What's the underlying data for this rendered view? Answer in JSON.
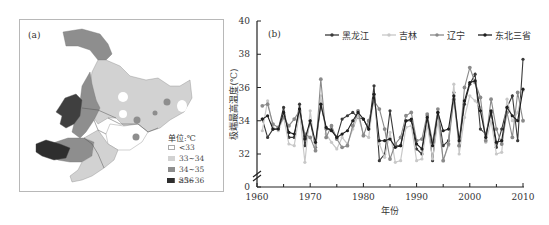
{
  "panel_a": {
    "label": "(a)",
    "legend_title": "单位:℃",
    "legend": [
      {
        "label": "<33",
        "color": "#ffffff"
      },
      {
        "label": "33~34",
        "color": "#d2d2d2"
      },
      {
        "label": "34~35",
        "color": "#8e8e8e"
      },
      {
        "label": "35~36",
        "color": "#5a5a5a"
      },
      {
        "label": "≥36",
        "color": "#2e2e2e"
      }
    ]
  },
  "chart_data": {
    "type": "line",
    "panel_label": "(b)",
    "title": "",
    "xlabel": "年份",
    "ylabel": "极端最高温度(℃)",
    "x_ticks": [
      "1960",
      "1970",
      "1980",
      "1990",
      "2000",
      "2010"
    ],
    "y_ticks": [
      "0",
      "32",
      "34",
      "36",
      "38",
      "40"
    ],
    "ylim": [
      31,
      40
    ],
    "y_axis_break": true,
    "xlim": [
      1960,
      2010
    ],
    "legend_position": "top-right",
    "x": [
      1961,
      1962,
      1963,
      1964,
      1965,
      1966,
      1967,
      1968,
      1969,
      1970,
      1971,
      1972,
      1973,
      1974,
      1975,
      1976,
      1977,
      1978,
      1979,
      1980,
      1981,
      1982,
      1983,
      1984,
      1985,
      1986,
      1987,
      1988,
      1989,
      1990,
      1991,
      1992,
      1993,
      1994,
      1995,
      1996,
      1997,
      1998,
      1999,
      2000,
      2001,
      2002,
      2003,
      2004,
      2005,
      2006,
      2007,
      2008,
      2009,
      2010
    ],
    "series": [
      {
        "name": "黑龙江",
        "color": "#3a3a3a",
        "values": [
          34.1,
          33.0,
          33.5,
          33.5,
          34.8,
          33.0,
          33.0,
          35.0,
          32.5,
          34.0,
          32.4,
          35.0,
          33.5,
          33.5,
          33.0,
          34.1,
          34.3,
          34.5,
          34.2,
          34.1,
          33.5,
          36.1,
          31.6,
          32.0,
          34.6,
          32.5,
          32.5,
          34.0,
          34.0,
          32.3,
          32.0,
          34.3,
          31.6,
          34.5,
          32.5,
          32.8,
          35.7,
          32.5,
          35.0,
          36.2,
          36.8,
          33.5,
          33.2,
          34.5,
          32.4,
          33.5,
          34.8,
          35.5,
          32.8,
          37.7
        ]
      },
      {
        "name": "吉林",
        "color": "#c8c8c8",
        "values": [
          33.4,
          35.2,
          33.6,
          33.4,
          34.2,
          32.6,
          32.5,
          34.5,
          31.5,
          34.6,
          32.2,
          35.5,
          33.2,
          32.7,
          32.3,
          33.0,
          32.6,
          33.5,
          34.3,
          33.2,
          33.0,
          35.5,
          32.6,
          31.8,
          33.3,
          31.5,
          31.6,
          33.6,
          33.7,
          31.6,
          31.7,
          33.8,
          31.7,
          34.0,
          31.6,
          32.5,
          36.2,
          32.0,
          34.2,
          35.5,
          35.2,
          34.8,
          32.7,
          34.0,
          32.0,
          32.1,
          35.3,
          34.0,
          34.5,
          35.8
        ]
      },
      {
        "name": "辽宁",
        "color": "#8a8a8a",
        "values": [
          34.9,
          35.0,
          33.8,
          33.6,
          34.2,
          33.7,
          34.1,
          34.6,
          33.2,
          33.0,
          32.2,
          36.5,
          33.0,
          33.7,
          32.9,
          32.4,
          32.5,
          33.7,
          34.6,
          33.1,
          34.0,
          35.2,
          34.7,
          33.5,
          31.7,
          32.6,
          33.0,
          34.3,
          34.5,
          32.8,
          32.9,
          34.4,
          32.7,
          34.7,
          31.6,
          32.6,
          35.3,
          32.5,
          36.0,
          37.2,
          36.3,
          35.4,
          32.8,
          35.3,
          33.5,
          32.6,
          34.5,
          33.0,
          35.7,
          34.0
        ]
      },
      {
        "name": "东北三省",
        "color": "#1e1e1e",
        "values": [
          34.1,
          34.3,
          33.5,
          33.5,
          34.5,
          33.3,
          33.2,
          34.7,
          32.9,
          34.0,
          32.7,
          35.0,
          33.6,
          33.4,
          33.0,
          33.2,
          33.4,
          34.0,
          34.5,
          34.1,
          33.5,
          35.6,
          32.8,
          32.8,
          32.9,
          32.4,
          32.5,
          34.0,
          34.1,
          32.6,
          32.3,
          34.2,
          32.5,
          34.5,
          33.4,
          33.5,
          35.5,
          32.8,
          35.2,
          36.3,
          36.4,
          34.6,
          33.0,
          34.6,
          32.7,
          32.8,
          34.8,
          34.3,
          34.0,
          35.9
        ]
      }
    ]
  }
}
